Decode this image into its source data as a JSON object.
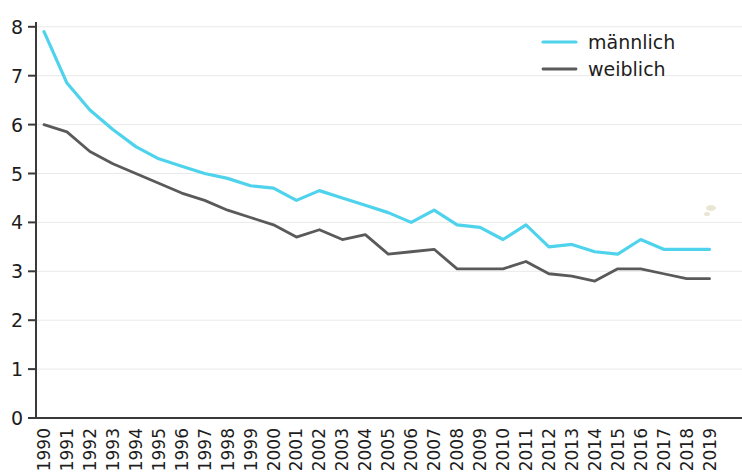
{
  "chart_data": {
    "type": "line",
    "title": "",
    "subtitle": "",
    "xlabel": "",
    "ylabel": "",
    "xlim": [
      1990,
      2019
    ],
    "ylim": [
      0,
      8
    ],
    "grid": true,
    "legend_position": "top-right",
    "x": [
      1990,
      1991,
      1992,
      1993,
      1994,
      1995,
      1996,
      1997,
      1998,
      1999,
      2000,
      2001,
      2002,
      2003,
      2004,
      2005,
      2006,
      2007,
      2008,
      2009,
      2010,
      2011,
      2012,
      2013,
      2014,
      2015,
      2016,
      2017,
      2018,
      2019
    ],
    "categories": [
      "1990",
      "1991",
      "1992",
      "1993",
      "1994",
      "1995",
      "1996",
      "1997",
      "1998",
      "1999",
      "2000",
      "2001",
      "2002",
      "2003",
      "2004",
      "2005",
      "2006",
      "2007",
      "2008",
      "2009",
      "2010",
      "2011",
      "2012",
      "2013",
      "2014",
      "2015",
      "2016",
      "2017",
      "2018",
      "2019"
    ],
    "ytick_labels": [
      "0",
      "1",
      "2",
      "3",
      "4",
      "5",
      "6",
      "7",
      "8"
    ],
    "ytick_values": [
      0,
      1,
      2,
      3,
      4,
      5,
      6,
      7,
      8
    ],
    "series": [
      {
        "name": "männlich",
        "color": "#4FD3EC",
        "values": [
          7.9,
          6.85,
          6.3,
          5.9,
          5.55,
          5.3,
          5.15,
          5.0,
          4.9,
          4.75,
          4.7,
          4.45,
          4.65,
          4.5,
          4.35,
          4.2,
          4.0,
          4.25,
          3.95,
          3.9,
          3.65,
          3.95,
          3.5,
          3.55,
          3.4,
          3.35,
          3.65,
          3.45,
          3.45,
          3.45
        ]
      },
      {
        "name": "weiblich",
        "color": "#5A5A5A",
        "values": [
          6.0,
          5.85,
          5.45,
          5.2,
          5.0,
          4.8,
          4.6,
          4.45,
          4.25,
          4.1,
          3.95,
          3.7,
          3.85,
          3.65,
          3.75,
          3.35,
          3.4,
          3.45,
          3.05,
          3.05,
          3.05,
          3.2,
          2.95,
          2.9,
          2.8,
          3.05,
          3.05,
          2.95,
          2.85,
          2.85
        ]
      }
    ],
    "legend": [
      {
        "label": "männlich",
        "color": "#4FD3EC"
      },
      {
        "label": "weiblich",
        "color": "#5A5A5A"
      }
    ]
  }
}
